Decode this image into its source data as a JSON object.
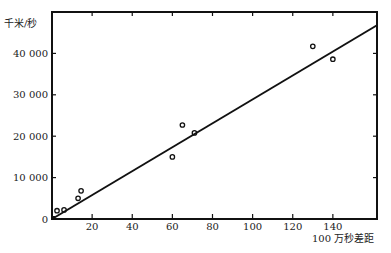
{
  "chart_data": {
    "type": "scatter",
    "title": "",
    "xlabel": "100 万秒差距",
    "ylabel": "千米/秒",
    "xlim": [
      0,
      162
    ],
    "ylim": [
      0,
      50000
    ],
    "x_ticks": [
      20,
      40,
      60,
      80,
      100,
      120,
      140
    ],
    "x_tick_labels": [
      "20",
      "40",
      "60",
      "80",
      "100",
      "120",
      "140"
    ],
    "y_ticks": [
      0,
      10000,
      20000,
      30000,
      40000
    ],
    "y_tick_labels": [
      "0",
      "10 000",
      "20 000",
      "30 000",
      "40 000"
    ],
    "grid": false,
    "legend": null,
    "series": [
      {
        "name": "observations",
        "type": "scatter",
        "marker": "open-circle",
        "x": [
          2.5,
          6,
          13,
          14.5,
          60,
          65,
          71,
          130,
          140
        ],
        "y": [
          2000,
          2200,
          5000,
          6800,
          15000,
          22700,
          20800,
          41700,
          38600
        ]
      },
      {
        "name": "fit-line",
        "type": "line",
        "x": [
          0,
          162
        ],
        "y": [
          0,
          46800
        ]
      }
    ]
  }
}
